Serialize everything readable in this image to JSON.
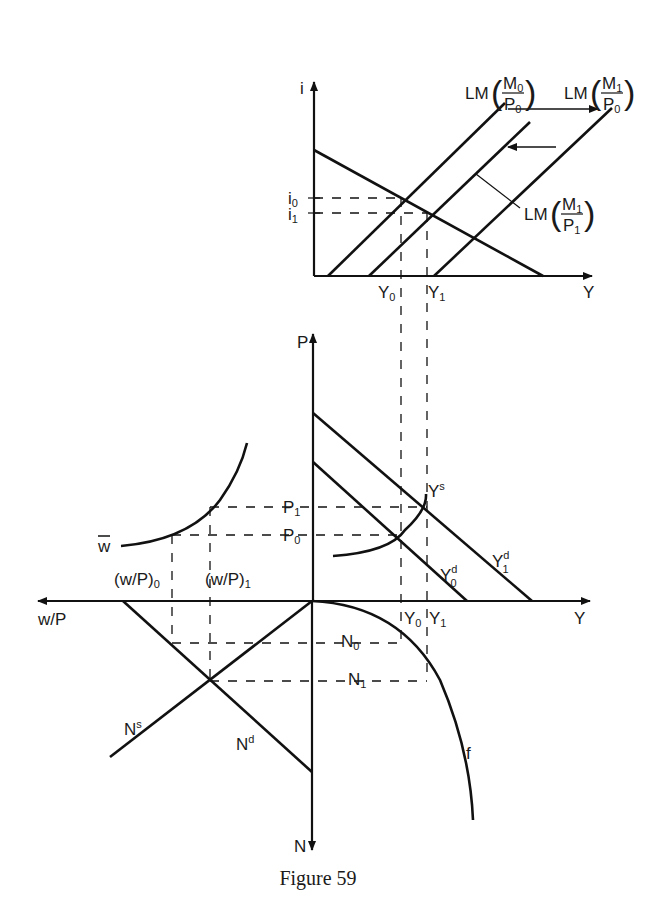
{
  "figure": {
    "caption": "Figure 59",
    "top_panel": {
      "y_axis_label": "i",
      "x_axis_label": "Y",
      "ticks": {
        "i0": "i",
        "i0_sub": "0",
        "i1": "i",
        "i1_sub": "1",
        "Y0": "Y",
        "Y0_sub": "0",
        "Y1": "Y",
        "Y1_sub": "1"
      },
      "curves": [
        {
          "name": "IS",
          "label": ""
        },
        {
          "name": "LM(M0/P0)",
          "prefix": "LM",
          "num": "M",
          "num_sub": "0",
          "den": "P",
          "den_sub": "0"
        },
        {
          "name": "LM(M1/P0)",
          "prefix": "LM",
          "num": "M",
          "num_sub": "1",
          "den": "P",
          "den_sub": "0"
        },
        {
          "name": "LM(M1/P1)",
          "prefix": "LM",
          "num": "M",
          "num_sub": "1",
          "den": "P",
          "den_sub": "1"
        }
      ],
      "arrows": [
        "shift-right",
        "shift-left"
      ]
    },
    "middle_panel": {
      "y_axis_label": "P",
      "x_axis_label": "Y",
      "ticks": {
        "P1": "P",
        "P1_sub": "1",
        "P0": "P",
        "P0_sub": "0"
      },
      "curves": [
        {
          "name": "Ys",
          "label": "Y",
          "sup": "s"
        },
        {
          "name": "Yd0",
          "label": "Y",
          "sup": "d",
          "sub": "0"
        },
        {
          "name": "Yd1",
          "label": "Y",
          "sup": "d",
          "sub": "1"
        }
      ]
    },
    "left_panel": {
      "x_axis_label": "w/P",
      "curve_wbar": "w",
      "ticks": {
        "wp0": "(w/P)",
        "wp0_sub": "0",
        "wp1": "(w/P)",
        "wp1_sub": "1"
      }
    },
    "bottom_panel": {
      "y_axis_label": "N",
      "ticks": {
        "N0": "N",
        "N0_sub": "0",
        "N1": "N",
        "N1_sub": "1",
        "Y0": "Y",
        "Y0_sub": "0",
        "Y1": "Y",
        "Y1_sub": "1"
      },
      "curves": [
        {
          "name": "Ns",
          "label": "N",
          "sup": "s"
        },
        {
          "name": "Nd",
          "label": "N",
          "sup": "d"
        },
        {
          "name": "f",
          "label": "f"
        }
      ]
    }
  }
}
